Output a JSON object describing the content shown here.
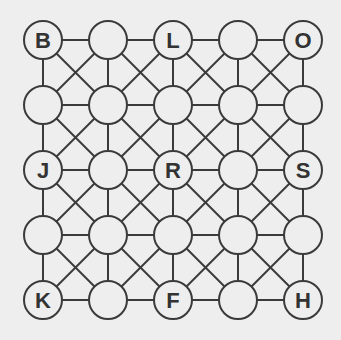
{
  "grid": {
    "rows": 5,
    "cols": 5,
    "origin_x": 43,
    "origin_y": 40,
    "spacing": 65,
    "radius": 19,
    "line_color": "#3a3a3a",
    "fill_color": "#eeeeee"
  },
  "labels": [
    [
      "B",
      "",
      "L",
      "",
      "O"
    ],
    [
      "",
      "",
      "",
      "",
      ""
    ],
    [
      "J",
      "",
      "R",
      "",
      "S"
    ],
    [
      "",
      "",
      "",
      "",
      ""
    ],
    [
      "K",
      "",
      "F",
      "",
      "H"
    ]
  ]
}
